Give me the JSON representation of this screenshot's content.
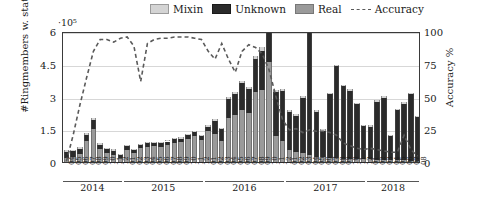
{
  "legend": {
    "items": [
      {
        "label": "Mixin",
        "color": "#d4d4d4",
        "type": "swatch",
        "name": "legend-mixin"
      },
      {
        "label": "Unknown",
        "color": "#2b2b2b",
        "type": "swatch",
        "name": "legend-unknown"
      },
      {
        "label": "Real",
        "color": "#9a9a9a",
        "type": "swatch",
        "name": "legend-real"
      },
      {
        "label": "Accuracy",
        "color": "#5a5a5a",
        "type": "dashed-line",
        "name": "legend-accuracy"
      }
    ]
  },
  "axes": {
    "y_multiplier": "·10⁵",
    "y_title": "#Ringmembers w. status",
    "y_ticks": [
      "0",
      "1.5",
      "3",
      "4.5",
      "6"
    ],
    "y2_title": "Accuracy %",
    "y2_ticks": [
      "0",
      "25",
      "50",
      "75",
      "100"
    ],
    "years": [
      "2014",
      "2015",
      "2016",
      "2017",
      "2018"
    ]
  },
  "chart_data": {
    "type": "bar",
    "title": "",
    "xlabel": "",
    "ylabel": "#Ringmembers w. status",
    "y2label": "Accuracy %",
    "ylim": [
      0,
      600000
    ],
    "y2lim": [
      0,
      100
    ],
    "y_multiplier": 100000,
    "grid": true,
    "legend_position": "top",
    "stacked": true,
    "categories": [
      "2014-04",
      "2014-05",
      "2014-06",
      "2014-07",
      "2014-08",
      "2014-09",
      "2014-10",
      "2014-11",
      "2014-12",
      "2015-01",
      "2015-02",
      "2015-03",
      "2015-04",
      "2015-05",
      "2015-06",
      "2015-07",
      "2015-08",
      "2015-09",
      "2015-10",
      "2015-11",
      "2015-12",
      "2016-01",
      "2016-02",
      "2016-03",
      "2016-04",
      "2016-05",
      "2016-06",
      "2016-07",
      "2016-08",
      "2016-09",
      "2016-10",
      "2016-11",
      "2016-12",
      "2017-01",
      "2017-02",
      "2017-03",
      "2017-04",
      "2017-05",
      "2017-06",
      "2017-07",
      "2017-08",
      "2017-09",
      "2017-10",
      "2017-11",
      "2017-12",
      "2018-01",
      "2018-02",
      "2018-03",
      "2018-04",
      "2018-05",
      "2018-06",
      "2018-07",
      "2018-08"
    ],
    "month_labels": [
      "04",
      "05",
      "06",
      "07",
      "08",
      "09",
      "10",
      "11",
      "12",
      "01",
      "02",
      "03",
      "04",
      "05",
      "06",
      "07",
      "08",
      "09",
      "10",
      "11",
      "12",
      "01",
      "02",
      "03",
      "04",
      "05",
      "06",
      "07",
      "08",
      "09",
      "10",
      "11",
      "12",
      "01",
      "02",
      "03",
      "04",
      "05",
      "06",
      "07",
      "08",
      "09",
      "10",
      "11",
      "12",
      "01",
      "02",
      "03",
      "04",
      "05",
      "06",
      "07",
      "08"
    ],
    "series": [
      {
        "name": "Real",
        "color": "#9a9a9a",
        "values": [
          18000,
          22000,
          35000,
          95000,
          150000,
          60000,
          42000,
          30000,
          18000,
          55000,
          40000,
          62000,
          68000,
          72000,
          70000,
          80000,
          88000,
          92000,
          105000,
          120000,
          100000,
          140000,
          130000,
          95000,
          200000,
          215000,
          240000,
          225000,
          320000,
          330000,
          460000,
          120000,
          95000,
          55000,
          45000,
          40000,
          30000,
          25000,
          22000,
          20000,
          18000,
          16000,
          15000,
          14000,
          13000,
          12000,
          11000,
          10000,
          9000,
          8000,
          7000,
          6000,
          5000
        ]
      },
      {
        "name": "Unknown",
        "color": "#2b2b2b",
        "values": [
          30000,
          28000,
          26000,
          30000,
          42000,
          20000,
          18000,
          22000,
          15000,
          18000,
          14000,
          16000,
          18000,
          15000,
          16000,
          14000,
          16000,
          15000,
          18000,
          16000,
          18000,
          22000,
          60000,
          55000,
          90000,
          95000,
          120000,
          110000,
          150000,
          180000,
          135000,
          200000,
          230000,
          175000,
          165000,
          255000,
          590000,
          205000,
          120000,
          290000,
          420000,
          330000,
          310000,
          250000,
          150000,
          150000,
          265000,
          285000,
          110000,
          230000,
          260000,
          305000,
          200000
        ]
      },
      {
        "name": "Mixin",
        "color": "#d4d4d4",
        "values": [
          6000,
          6000,
          6000,
          6000,
          8000,
          6000,
          6000,
          6000,
          5000,
          6000,
          5000,
          6000,
          6000,
          6000,
          6000,
          6000,
          6000,
          6000,
          6000,
          6000,
          6000,
          8000,
          8000,
          8000,
          10000,
          10000,
          12000,
          10000,
          14000,
          16000,
          12000,
          10000,
          10000,
          9000,
          9000,
          9000,
          9000,
          9000,
          8000,
          8000,
          8000,
          8000,
          8000,
          8000,
          8000,
          8000,
          8000,
          8000,
          7000,
          7000,
          7000,
          7000,
          7000
        ]
      }
    ],
    "accuracy": {
      "name": "Accuracy",
      "color": "#5a5a5a",
      "style": "dashed",
      "unit": "%",
      "values": [
        2,
        22,
        45,
        66,
        86,
        95,
        95,
        93,
        96,
        97,
        90,
        63,
        92,
        95,
        96,
        96,
        97,
        97,
        97,
        96,
        95,
        86,
        80,
        92,
        80,
        70,
        86,
        91,
        89,
        84,
        72,
        52,
        34,
        26,
        27,
        24,
        26,
        25,
        25,
        24,
        22,
        16,
        14,
        12,
        11,
        12,
        11,
        10,
        9,
        9,
        22,
        11,
        6
      ]
    }
  }
}
